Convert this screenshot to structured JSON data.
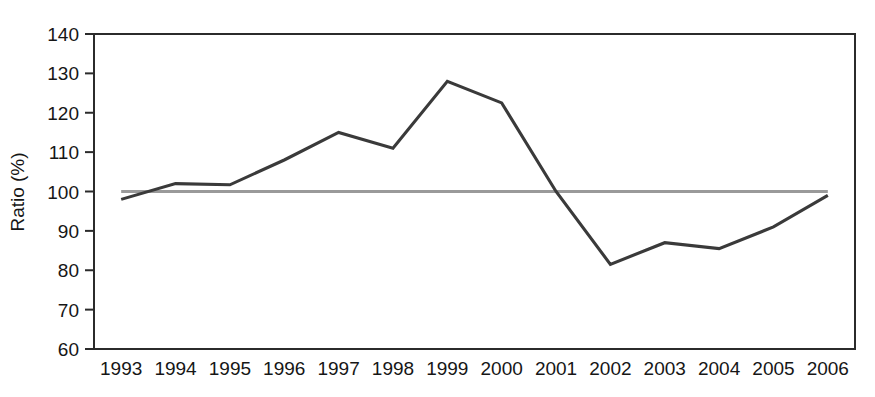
{
  "chart_data": {
    "type": "line",
    "title": "",
    "xlabel": "",
    "ylabel": "Ratio (%)",
    "categories": [
      "1993",
      "1994",
      "1995",
      "1996",
      "1997",
      "1998",
      "1999",
      "2000",
      "2001",
      "2002",
      "2003",
      "2004",
      "2005",
      "2006"
    ],
    "values": [
      98,
      102,
      101.7,
      108,
      115,
      111,
      128,
      122.5,
      100,
      81.5,
      87,
      85.5,
      91,
      99
    ],
    "series": [
      {
        "name": "Ratio",
        "color": "#3a3a3a",
        "values": [
          98,
          102,
          101.7,
          108,
          115,
          111,
          128,
          122.5,
          100,
          81.5,
          87,
          85.5,
          91,
          99
        ]
      }
    ],
    "reference_line": {
      "name": "100% reference",
      "value": 100,
      "color": "#9a9a9a"
    },
    "ylim": [
      60,
      140
    ],
    "yticks": [
      60,
      70,
      80,
      90,
      100,
      110,
      120,
      130,
      140
    ],
    "ytick_labels": [
      "60",
      "70",
      "80",
      "90",
      "100",
      "110",
      "120",
      "130",
      "140"
    ],
    "grid": false,
    "legend": "none",
    "frame": "box"
  },
  "axes": {
    "y_axis_title": "Ratio (%)"
  }
}
